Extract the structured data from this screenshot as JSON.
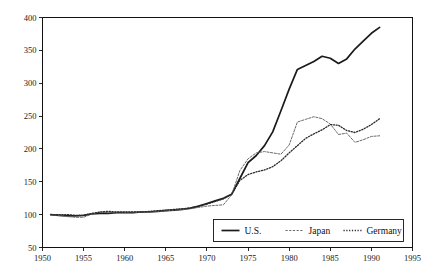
{
  "chart_data": {
    "type": "line",
    "title": "",
    "subtitle": "",
    "xlabel": "",
    "ylabel": "",
    "xlim": [
      1950,
      1995
    ],
    "ylim": [
      50,
      400
    ],
    "grid": false,
    "legend_position": "bottom-center",
    "x_ticks": [
      1950,
      1955,
      1960,
      1965,
      1970,
      1975,
      1980,
      1985,
      1990,
      1995
    ],
    "y_ticks": [
      50,
      100,
      150,
      200,
      250,
      300,
      350,
      400
    ],
    "x_tick_labels": [
      "1950",
      "1955",
      "1960",
      "1965",
      "1970",
      "1975",
      "1980",
      "1985",
      "1990",
      "1995"
    ],
    "y_tick_labels": [
      "50",
      "100",
      "150",
      "200",
      "250",
      "300",
      "350",
      "400"
    ],
    "x": [
      1951,
      1952,
      1953,
      1954,
      1955,
      1956,
      1957,
      1958,
      1959,
      1960,
      1961,
      1962,
      1963,
      1964,
      1965,
      1966,
      1967,
      1968,
      1969,
      1970,
      1971,
      1972,
      1973,
      1974,
      1975,
      1976,
      1977,
      1978,
      1979,
      1980,
      1981,
      1982,
      1983,
      1984,
      1985,
      1986,
      1987,
      1988,
      1989,
      1990,
      1991
    ],
    "series": [
      {
        "name": "U.S.",
        "style": "solid",
        "color": "#1a1a1a",
        "width": 1.7,
        "values": [
          100,
          99,
          98,
          98,
          99,
          101,
          102,
          102,
          103,
          103,
          103,
          104,
          104,
          105,
          106,
          107,
          108,
          110,
          113,
          117,
          121,
          125,
          131,
          155,
          179,
          190,
          205,
          226,
          258,
          291,
          321,
          327,
          333,
          341,
          338,
          330,
          337,
          352,
          364,
          376,
          385
        ]
      },
      {
        "name": "Japan",
        "style": "dashed",
        "color": "#6b6b6b",
        "width": 1.0,
        "values": [
          100,
          99,
          97,
          96,
          96,
          101,
          104,
          103,
          103,
          103,
          103,
          104,
          104,
          105,
          106,
          107,
          108,
          109,
          111,
          113,
          114,
          115,
          130,
          167,
          185,
          194,
          196,
          194,
          192,
          206,
          241,
          245,
          249,
          246,
          238,
          222,
          224,
          210,
          214,
          219,
          220
        ]
      },
      {
        "name": "Germany",
        "style": "dotted",
        "color": "#2b2b2b",
        "width": 1.3,
        "values": [
          100,
          100,
          100,
          99,
          99,
          102,
          104,
          105,
          104,
          104,
          104,
          104,
          105,
          106,
          107,
          108,
          109,
          110,
          113,
          116,
          120,
          124,
          131,
          152,
          161,
          165,
          168,
          173,
          182,
          194,
          205,
          216,
          223,
          229,
          237,
          236,
          228,
          225,
          230,
          237,
          246
        ]
      }
    ],
    "legend": [
      {
        "label": "U.S.",
        "style": "solid",
        "color": "#1a1a1a"
      },
      {
        "label": "Japan",
        "style": "dashed",
        "color": "#6b6b6b"
      },
      {
        "label": "Germany",
        "style": "dotted",
        "color": "#2b2b2b"
      }
    ]
  },
  "colors": {
    "background": "#ffffff",
    "axis": "#111111",
    "text": "#1a1a1a",
    "us": "#1a1a1a",
    "japan": "#6b6b6b",
    "germany": "#2b2b2b"
  }
}
